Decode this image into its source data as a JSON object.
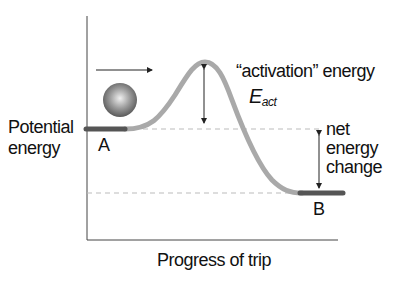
{
  "diagram": {
    "type": "energy-profile",
    "y_axis_label": [
      "Potential",
      "energy"
    ],
    "x_axis_label": "Progress of trip",
    "start_label": "A",
    "end_label": "B",
    "activation_label": "“activation” energy",
    "activation_symbol": "E",
    "activation_subscript": "act",
    "net_change_label": [
      "net",
      "energy",
      "change"
    ],
    "colors": {
      "curve": "#a9a9a9",
      "platform": "#555555",
      "axis": "#333333",
      "dashed": "#bbbbbb",
      "ball_light": "#e8e8e8",
      "ball_dark": "#666666",
      "text": "#111111"
    }
  }
}
